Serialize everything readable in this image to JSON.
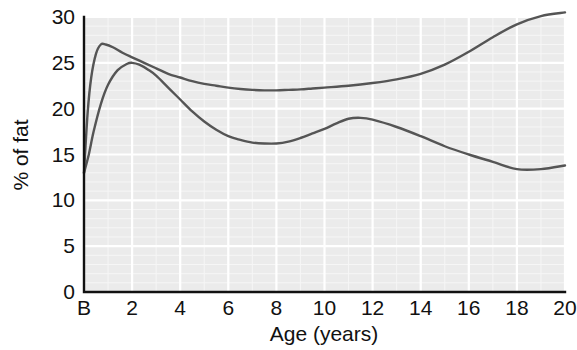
{
  "chart_data": {
    "type": "line",
    "title": "",
    "xlabel": "Age (years)",
    "ylabel": "% of fat",
    "xlim": [
      0,
      20
    ],
    "ylim": [
      0,
      30
    ],
    "grid": true,
    "legend": null,
    "x_tick_labels": [
      "B",
      "2",
      "4",
      "6",
      "8",
      "10",
      "12",
      "14",
      "16",
      "18",
      "20"
    ],
    "x_tick_values": [
      0,
      2,
      4,
      6,
      8,
      10,
      12,
      14,
      16,
      18,
      20
    ],
    "y_tick_labels": [
      "0",
      "5",
      "10",
      "15",
      "20",
      "25",
      "30"
    ],
    "y_tick_values": [
      0,
      5,
      10,
      15,
      20,
      25,
      30
    ],
    "x_minor_step": 1,
    "y_minor_step": 1,
    "series": [
      {
        "name": "upper-curve",
        "color": "#555555",
        "x": [
          0,
          0.15,
          0.3,
          0.5,
          0.7,
          0.9,
          1.2,
          1.6,
          2,
          2.5,
          3,
          3.5,
          4,
          4.5,
          5,
          5.5,
          6,
          6.5,
          7,
          7.5,
          8,
          8.5,
          9,
          9.5,
          10,
          11,
          12,
          13,
          14,
          15,
          16,
          17,
          18,
          19,
          20
        ],
        "y": [
          13.0,
          19.5,
          23.4,
          26.0,
          27.0,
          27.0,
          26.7,
          26.1,
          25.6,
          25.0,
          24.4,
          23.8,
          23.4,
          23.0,
          22.7,
          22.5,
          22.3,
          22.15,
          22.05,
          22.0,
          22.0,
          22.05,
          22.1,
          22.2,
          22.3,
          22.5,
          22.8,
          23.2,
          23.8,
          24.8,
          26.2,
          27.8,
          29.2,
          30.1,
          30.5
        ]
      },
      {
        "name": "lower-curve",
        "color": "#555555",
        "x": [
          0,
          0.2,
          0.4,
          0.7,
          1.0,
          1.4,
          1.8,
          2.0,
          2.3,
          2.7,
          3,
          3.5,
          4,
          4.5,
          5,
          5.5,
          6,
          6.5,
          7,
          7.5,
          8,
          8.5,
          9,
          9.5,
          10,
          10.5,
          11,
          11.5,
          12,
          13,
          14,
          15,
          16,
          17,
          18,
          19,
          20
        ],
        "y": [
          13.0,
          15.0,
          17.5,
          20.5,
          22.6,
          24.2,
          24.9,
          25.0,
          24.8,
          24.2,
          23.6,
          22.3,
          21.0,
          19.7,
          18.6,
          17.7,
          17.0,
          16.6,
          16.3,
          16.2,
          16.2,
          16.4,
          16.8,
          17.3,
          17.8,
          18.4,
          18.9,
          19.0,
          18.8,
          18.0,
          17.0,
          15.9,
          15.0,
          14.2,
          13.4,
          13.4,
          13.8
        ]
      }
    ],
    "annotations": [
      {
        "text": "B denotes birth",
        "visible": false
      }
    ]
  },
  "figure": {
    "background_color": "#ffffff",
    "plot_background_color": "#ebebeb",
    "grid_color": "#ffffff",
    "axis_color": "#111111",
    "curve_color": "#555555"
  }
}
